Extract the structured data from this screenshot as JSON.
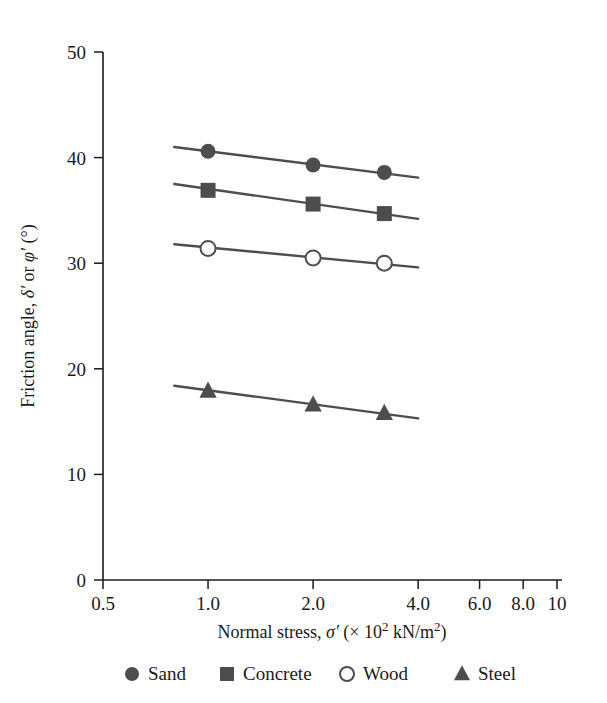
{
  "chart_data": {
    "type": "line",
    "title": "",
    "xlabel": "Normal stress, σ′ (× 10² kN/m²)",
    "ylabel": "Friction angle, δ′ or φ′ (°)",
    "xscale": "log",
    "yscale": "linear",
    "xlim": [
      0.5,
      10
    ],
    "ylim": [
      0,
      50
    ],
    "grid": false,
    "legend_position": "bottom",
    "x_tick_labels": [
      "0.5",
      "1.0",
      "2.0",
      "4.0",
      "6.0",
      "8.0",
      "10"
    ],
    "x_tick_values": [
      0.5,
      1.0,
      2.0,
      4.0,
      6.0,
      8.0,
      10
    ],
    "y_tick_labels": [
      "0",
      "10",
      "20",
      "30",
      "40",
      "50"
    ],
    "y_tick_values": [
      0,
      10,
      20,
      30,
      40,
      50
    ],
    "x": [
      1.0,
      2.0,
      3.2
    ],
    "series": [
      {
        "name": "Sand",
        "marker": "filled-circle",
        "color": "#4d4d4d",
        "values": [
          40.6,
          39.3,
          38.6
        ],
        "fit_line": {
          "x0": 0.8,
          "y0": 41.0,
          "x1": 4.0,
          "y1": 38.1
        }
      },
      {
        "name": "Concrete",
        "marker": "filled-square",
        "color": "#4d4d4d",
        "values": [
          36.9,
          35.6,
          34.7
        ],
        "fit_line": {
          "x0": 0.8,
          "y0": 37.5,
          "x1": 4.0,
          "y1": 34.2
        }
      },
      {
        "name": "Wood",
        "marker": "open-circle",
        "color": "#4d4d4d",
        "values": [
          31.4,
          30.5,
          30.0
        ],
        "fit_line": {
          "x0": 0.8,
          "y0": 31.8,
          "x1": 4.0,
          "y1": 29.6
        }
      },
      {
        "name": "Steel",
        "marker": "filled-triangle",
        "color": "#4d4d4d",
        "values": [
          17.9,
          16.6,
          15.8
        ],
        "fit_line": {
          "x0": 0.8,
          "y0": 18.4,
          "x1": 4.0,
          "y1": 15.3
        }
      }
    ]
  },
  "axis": {
    "x_title_parts": {
      "lead": "Normal stress, ",
      "sigma": "σ",
      "prime": "′",
      "open": " (× 10",
      "exp": "2",
      "units": " kN/m",
      "units_exp": "2",
      "close": ")"
    },
    "y_title_parts": {
      "lead": "Friction angle, ",
      "delta": "δ",
      "prime1": "′",
      "or": " or ",
      "phi": "φ",
      "prime2": "′",
      "deg": " (°)"
    }
  },
  "legend": {
    "items": [
      {
        "label": "Sand",
        "marker": "filled-circle"
      },
      {
        "label": "Concrete",
        "marker": "filled-square"
      },
      {
        "label": "Wood",
        "marker": "open-circle"
      },
      {
        "label": "Steel",
        "marker": "filled-triangle"
      }
    ]
  },
  "style": {
    "ink": "#1a1a1a",
    "series_color": "#4d4d4d",
    "background": "#ffffff"
  }
}
